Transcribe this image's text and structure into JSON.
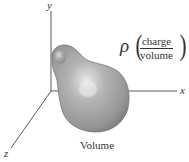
{
  "diagram": {
    "type": "3d-coordinate-illustration",
    "axes": {
      "x": {
        "label": "x"
      },
      "y": {
        "label": "y"
      },
      "z": {
        "label": "z"
      }
    },
    "density": {
      "symbol": "ρ",
      "numerator": "charge",
      "denominator": "volume",
      "left_paren": "(",
      "right_paren": ")"
    },
    "region": {
      "caption": "Volume",
      "fill_color": "#9a9a9a",
      "highlight_color": "#e0e0e0",
      "edge_color": "#6e6e6e"
    },
    "axis_color": "#5a5a5a",
    "text_color": "#333333"
  }
}
